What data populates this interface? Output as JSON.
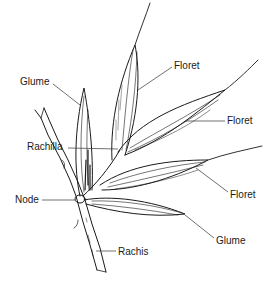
{
  "diagram": {
    "colors": {
      "ink": "#1a1a1a",
      "leader": "#333333",
      "background": "#ffffff"
    },
    "labels": [
      {
        "id": "glume-upper",
        "text": "Glume",
        "x": 20,
        "y": 76
      },
      {
        "id": "floret-top",
        "text": "Floret",
        "x": 174,
        "y": 60
      },
      {
        "id": "floret-right",
        "text": "Floret",
        "x": 227,
        "y": 115
      },
      {
        "id": "rachilla",
        "text": "Rachilla",
        "x": 27,
        "y": 141
      },
      {
        "id": "node",
        "text": "Node",
        "x": 15,
        "y": 194
      },
      {
        "id": "floret-lower",
        "text": "Floret",
        "x": 230,
        "y": 189
      },
      {
        "id": "glume-lower",
        "text": "Glume",
        "x": 216,
        "y": 235
      },
      {
        "id": "rachis",
        "text": "Rachis",
        "x": 118,
        "y": 246
      }
    ]
  }
}
